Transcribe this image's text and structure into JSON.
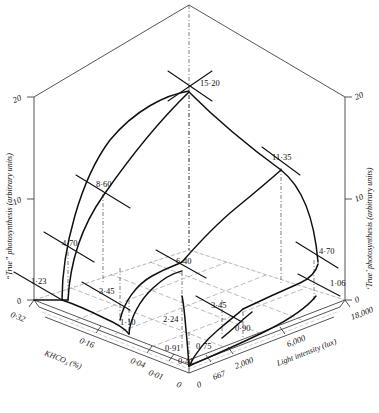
{
  "figure": {
    "kind": "3d-response-surface-diagram"
  },
  "axes": {
    "vertical_left": {
      "title": "“True” photosynthesis (arbitrary units)",
      "ticks": [
        "0",
        "10",
        "20"
      ]
    },
    "vertical_right": {
      "title": "‘True’ photosynthesis (arbitrary units)",
      "ticks": [
        "0",
        "10",
        "20"
      ]
    },
    "depth_left": {
      "title": "KHCO₃ (%)",
      "ticks": [
        "0·32",
        "0·16",
        "0·04",
        "0·01",
        "0"
      ]
    },
    "depth_right": {
      "title": "Light intensity (lux)",
      "ticks": [
        "0",
        "667",
        "2,000",
        "6,000",
        "18,000"
      ]
    }
  },
  "chart_data": {
    "type": "line",
    "title": "",
    "xlabel": "KHCO₃ (%) / Light intensity (lux)",
    "ylabel": "“True” photosynthesis (arbitrary units)",
    "zlim": [
      0,
      20
    ],
    "grid": true,
    "legend": "none",
    "khco3_levels": [
      "0",
      "0·01",
      "0·04",
      "0·16",
      "0·32"
    ],
    "light_levels": [
      "0",
      "667",
      "2,000",
      "6,000",
      "18,000"
    ],
    "data_point_labels": [
      {
        "value": "15·20",
        "x": 200,
        "y": 86
      },
      {
        "value": "11·35",
        "x": 272,
        "y": 160
      },
      {
        "value": "8·60",
        "x": 96,
        "y": 187
      },
      {
        "value": "6·40",
        "x": 176,
        "y": 264
      },
      {
        "value": "4·70",
        "x": 62,
        "y": 246
      },
      {
        "value": "4·70",
        "x": 319,
        "y": 254
      },
      {
        "value": "3·45",
        "x": 99,
        "y": 294
      },
      {
        "value": "3·45",
        "x": 211,
        "y": 308
      },
      {
        "value": "2·24",
        "x": 163,
        "y": 322
      },
      {
        "value": "1·23",
        "x": 31,
        "y": 284
      },
      {
        "value": "1·06",
        "x": 330,
        "y": 286
      },
      {
        "value": "1·10",
        "x": 120,
        "y": 325
      },
      {
        "value": "0·90",
        "x": 235,
        "y": 331
      },
      {
        "value": "0·91",
        "x": 165,
        "y": 351
      },
      {
        "value": "0·75",
        "x": 196,
        "y": 349
      },
      {
        "value": "0·41",
        "x": 178,
        "y": 364
      }
    ],
    "series": [
      {
        "name": "light-response at KHCO3 0·32",
        "values": [
          "1·23",
          "4·70",
          "8·60",
          "15·20"
        ]
      },
      {
        "name": "light-response at KHCO3 0·16",
        "values": [
          "1·10",
          "3·45",
          "6·40",
          "11·35"
        ]
      },
      {
        "name": "light-response at KHCO3 0·04",
        "values": [
          "0·91",
          "2·24",
          "3·45",
          "4·70"
        ]
      },
      {
        "name": "light-response at KHCO3 0·01",
        "values": [
          "0·41",
          "0·75",
          "0·90",
          "1·06"
        ]
      }
    ]
  }
}
